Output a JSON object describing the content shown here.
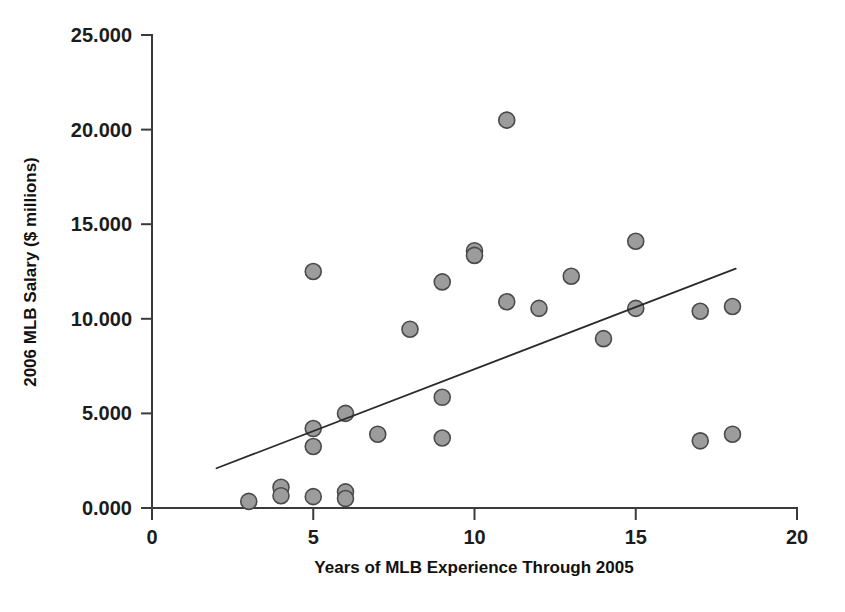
{
  "chart_data": {
    "type": "scatter",
    "title": "",
    "xlabel": "Years of MLB Experience Through 2005",
    "ylabel": "2006 MLB Salary ($ millions)",
    "xlim": [
      0,
      20
    ],
    "ylim": [
      0,
      25
    ],
    "grid": false,
    "legend": null,
    "x_ticks": [
      0,
      5,
      10,
      15,
      20
    ],
    "x_tick_labels": [
      "0",
      "5",
      "10",
      "15",
      "20"
    ],
    "y_ticks": [
      0,
      5,
      10,
      15,
      20,
      25
    ],
    "y_tick_labels": [
      "0.000",
      "5.000",
      "10.000",
      "15.000",
      "20.000",
      "25.000"
    ],
    "marker": {
      "shape": "circle",
      "fill_color": "#9c9c9c",
      "edge_color": "#4a4a4a",
      "radius_px": 8
    },
    "points": [
      {
        "x": 3,
        "y": 0.35
      },
      {
        "x": 4,
        "y": 1.1
      },
      {
        "x": 4,
        "y": 0.65
      },
      {
        "x": 5,
        "y": 12.5
      },
      {
        "x": 5,
        "y": 4.2
      },
      {
        "x": 5,
        "y": 3.25
      },
      {
        "x": 5,
        "y": 0.6
      },
      {
        "x": 6,
        "y": 5.0
      },
      {
        "x": 6,
        "y": 0.85
      },
      {
        "x": 6,
        "y": 0.5
      },
      {
        "x": 7,
        "y": 3.9
      },
      {
        "x": 8,
        "y": 9.45
      },
      {
        "x": 9,
        "y": 11.95
      },
      {
        "x": 9,
        "y": 5.85
      },
      {
        "x": 9,
        "y": 3.7
      },
      {
        "x": 10,
        "y": 13.6
      },
      {
        "x": 10,
        "y": 13.35
      },
      {
        "x": 11,
        "y": 20.5
      },
      {
        "x": 11,
        "y": 10.9
      },
      {
        "x": 12,
        "y": 10.55
      },
      {
        "x": 13,
        "y": 12.25
      },
      {
        "x": 14,
        "y": 8.95
      },
      {
        "x": 15,
        "y": 14.1
      },
      {
        "x": 15,
        "y": 10.55
      },
      {
        "x": 17,
        "y": 10.4
      },
      {
        "x": 17,
        "y": 3.55
      },
      {
        "x": 18,
        "y": 10.65
      },
      {
        "x": 18,
        "y": 3.9
      }
    ],
    "trend_line": {
      "type": "linear-fit",
      "x_start": 2.0,
      "y_start": 2.1,
      "x_end": 18.1,
      "y_end": 12.65,
      "color": "#2b2b2b"
    }
  }
}
